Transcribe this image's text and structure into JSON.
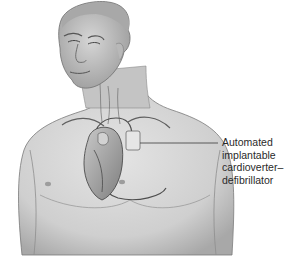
{
  "figure": {
    "colors": {
      "skin": "#d9d9d9",
      "skin_shade": "#a9a9a9",
      "outline": "#6b6b6b",
      "heart": "#8c8c8c",
      "device": "#e6e6e6",
      "line": "#3a3a3a"
    }
  },
  "annotations": [
    {
      "label": "Automated\nimplantable\ncardioverter–\ndefibrillator",
      "target": "device"
    }
  ]
}
